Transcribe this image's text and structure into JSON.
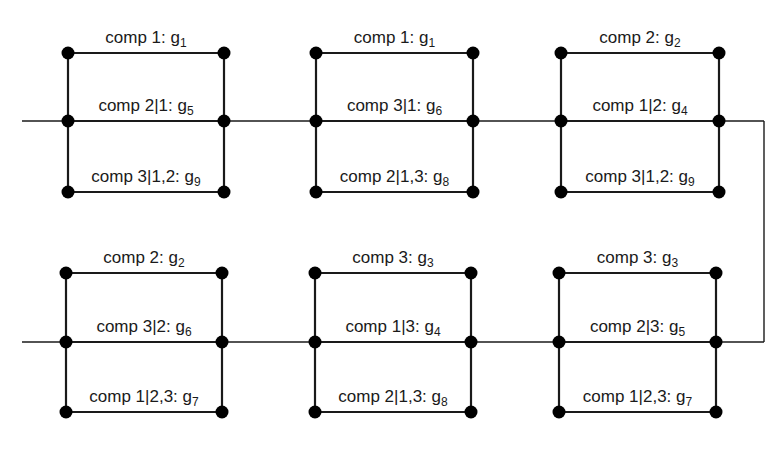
{
  "diagram": {
    "type": "network-of-parallel-blocks",
    "rows": [
      {
        "id": "top",
        "line_y": 121,
        "blocks": [
          {
            "id": "block-1",
            "x_left": 68,
            "x_right": 224,
            "y_top": 53,
            "y_mid": 121,
            "y_bot": 192,
            "edges": [
              {
                "text": "comp 1: g",
                "sub": "1"
              },
              {
                "text": "comp 2|1: g",
                "sub": "5"
              },
              {
                "text": "comp 3|1,2: g",
                "sub": "9"
              }
            ]
          },
          {
            "id": "block-2",
            "x_left": 316,
            "x_right": 473,
            "y_top": 53,
            "y_mid": 121,
            "y_bot": 192,
            "edges": [
              {
                "text": "comp 1: g",
                "sub": "1"
              },
              {
                "text": "comp 3|1: g",
                "sub": "6"
              },
              {
                "text": "comp 2|1,3: g",
                "sub": "8"
              }
            ]
          },
          {
            "id": "block-3",
            "x_left": 561,
            "x_right": 719,
            "y_top": 53,
            "y_mid": 121,
            "y_bot": 192,
            "edges": [
              {
                "text": "comp 2: g",
                "sub": "2"
              },
              {
                "text": "comp 1|2: g",
                "sub": "4"
              },
              {
                "text": "comp 3|1,2: g",
                "sub": "9"
              }
            ]
          }
        ]
      },
      {
        "id": "bottom",
        "line_y": 342,
        "blocks": [
          {
            "id": "block-4",
            "x_left": 66,
            "x_right": 222,
            "y_top": 273,
            "y_mid": 342,
            "y_bot": 412,
            "edges": [
              {
                "text": "comp 2: g",
                "sub": "2"
              },
              {
                "text": "comp 3|2: g",
                "sub": "6"
              },
              {
                "text": "comp 1|2,3: g",
                "sub": "7"
              }
            ]
          },
          {
            "id": "block-5",
            "x_left": 315,
            "x_right": 471,
            "y_top": 273,
            "y_mid": 342,
            "y_bot": 412,
            "edges": [
              {
                "text": "comp 3: g",
                "sub": "3"
              },
              {
                "text": "comp 1|3: g",
                "sub": "4"
              },
              {
                "text": "comp 2|1,3: g",
                "sub": "8"
              }
            ]
          },
          {
            "id": "block-6",
            "x_left": 559,
            "x_right": 716,
            "y_top": 273,
            "y_mid": 342,
            "y_bot": 412,
            "edges": [
              {
                "text": "comp 3: g",
                "sub": "3"
              },
              {
                "text": "comp 2|3: g",
                "sub": "5"
              },
              {
                "text": "comp 1|2,3: g",
                "sub": "7"
              }
            ]
          }
        ]
      }
    ],
    "connector": {
      "x_start": 22,
      "x_right": 764,
      "y_top": 121,
      "y_bottom": 342
    },
    "colors": {
      "line": "#1a1a1a",
      "node": "#000000",
      "background": "#ffffff"
    }
  }
}
